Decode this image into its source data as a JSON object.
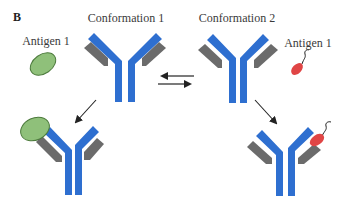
{
  "panel_label": "B",
  "labels": {
    "conformation_1": "Conformation 1",
    "conformation_2": "Conformation 2",
    "antigen_left": "Antigen 1",
    "antigen_right": "Antigen 1"
  },
  "colors": {
    "heavy_chain": "#2e6fd0",
    "light_chain": "#6b6b6b",
    "antigen_green_fill": "#8fc07a",
    "antigen_green_stroke": "#4c7a3c",
    "antigen_red_fill": "#e04545",
    "arrow": "#222222"
  },
  "diagram": {
    "nodes": [
      {
        "id": "ab_conf1",
        "label": "Conformation 1",
        "type": "antibody"
      },
      {
        "id": "ab_conf2",
        "label": "Conformation 2",
        "type": "antibody"
      },
      {
        "id": "antigen_green",
        "label": "Antigen 1",
        "type": "antigen"
      },
      {
        "id": "antigen_red",
        "label": "Antigen 1",
        "type": "antigen"
      },
      {
        "id": "complex_green",
        "label": "Conformation 1 bound to green antigen",
        "type": "complex"
      },
      {
        "id": "complex_red",
        "label": "Conformation 2 bound to red antigen",
        "type": "complex"
      }
    ],
    "edges": [
      {
        "from": "ab_conf1",
        "to": "ab_conf2",
        "type": "equilibrium"
      },
      {
        "from": "ab_conf1",
        "to": "complex_green",
        "type": "arrow"
      },
      {
        "from": "ab_conf2",
        "to": "complex_red",
        "type": "arrow"
      }
    ]
  }
}
